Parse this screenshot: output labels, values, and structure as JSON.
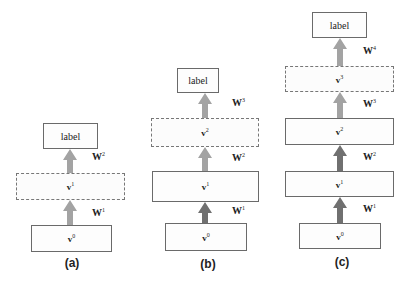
{
  "figure": {
    "colors": {
      "arrow_light": "#a3a3a3",
      "arrow_dark": "#707070",
      "box_border": "#6a6a6a"
    },
    "panels": [
      {
        "caption": "(a)",
        "layers": [
          {
            "name": "v",
            "sup": "0",
            "style": "solid"
          },
          {
            "name": "v",
            "sup": "1",
            "style": "dashed"
          },
          {
            "name": "label",
            "style": "solid"
          }
        ],
        "weights": [
          {
            "name": "W",
            "sup": "1"
          },
          {
            "name": "W",
            "sup": "2"
          }
        ]
      },
      {
        "caption": "(b)",
        "layers": [
          {
            "name": "v",
            "sup": "0",
            "style": "solid"
          },
          {
            "name": "v",
            "sup": "1",
            "style": "solid"
          },
          {
            "name": "v",
            "sup": "2",
            "style": "dashed"
          },
          {
            "name": "label",
            "style": "solid"
          }
        ],
        "weights": [
          {
            "name": "W",
            "sup": "1"
          },
          {
            "name": "W",
            "sup": "2"
          },
          {
            "name": "W",
            "sup": "3"
          }
        ]
      },
      {
        "caption": "(c)",
        "layers": [
          {
            "name": "v",
            "sup": "0",
            "style": "solid"
          },
          {
            "name": "v",
            "sup": "1",
            "style": "solid"
          },
          {
            "name": "v",
            "sup": "2",
            "style": "solid"
          },
          {
            "name": "v",
            "sup": "3",
            "style": "dashed"
          },
          {
            "name": "label",
            "style": "solid"
          }
        ],
        "weights": [
          {
            "name": "W",
            "sup": "1"
          },
          {
            "name": "W",
            "sup": "2"
          },
          {
            "name": "W",
            "sup": "3"
          },
          {
            "name": "W",
            "sup": "4"
          }
        ]
      }
    ]
  }
}
